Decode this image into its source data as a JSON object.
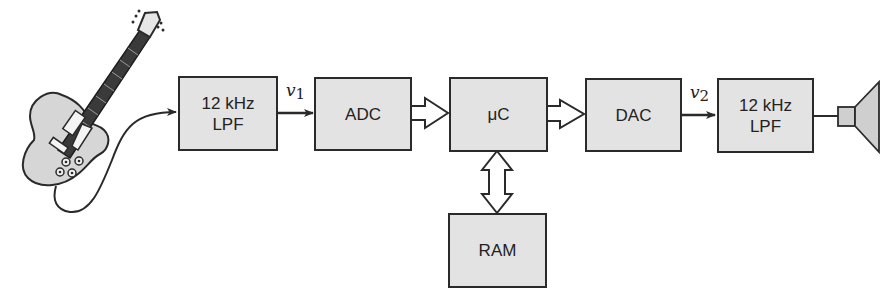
{
  "diagram": {
    "type": "block-diagram",
    "source": {
      "name": "electric guitar",
      "icon": "guitar-icon"
    },
    "sink": {
      "name": "loudspeaker",
      "icon": "speaker-icon"
    },
    "blocks": [
      {
        "id": "lpf1",
        "line1": "12 kHz",
        "line2": "LPF"
      },
      {
        "id": "adc",
        "line1": "ADC"
      },
      {
        "id": "uc",
        "line1": "μC"
      },
      {
        "id": "dac",
        "line1": "DAC"
      },
      {
        "id": "lpf2",
        "line1": "12 kHz",
        "line2": "LPF"
      },
      {
        "id": "ram",
        "line1": "RAM"
      }
    ],
    "signals": {
      "v1": {
        "symbol": "v",
        "subscript": "1"
      },
      "v2": {
        "symbol": "v",
        "subscript": "2"
      }
    },
    "connections": [
      {
        "from": "guitar",
        "to": "lpf1",
        "style": "cable-arrow"
      },
      {
        "from": "lpf1",
        "to": "adc",
        "style": "line-arrow",
        "label": "v1"
      },
      {
        "from": "adc",
        "to": "uc",
        "style": "bus-arrow"
      },
      {
        "from": "uc",
        "to": "dac",
        "style": "bus-arrow"
      },
      {
        "from": "uc",
        "to": "ram",
        "style": "bidirectional-bus"
      },
      {
        "from": "dac",
        "to": "lpf2",
        "style": "line-arrow",
        "label": "v2"
      },
      {
        "from": "lpf2",
        "to": "speaker",
        "style": "line"
      }
    ],
    "colors": {
      "block_fill": "#e3e3e3",
      "stroke": "#2a2a2a",
      "guitar_body": "#d6d6d6",
      "fretboard": "#3a3a3a"
    }
  }
}
